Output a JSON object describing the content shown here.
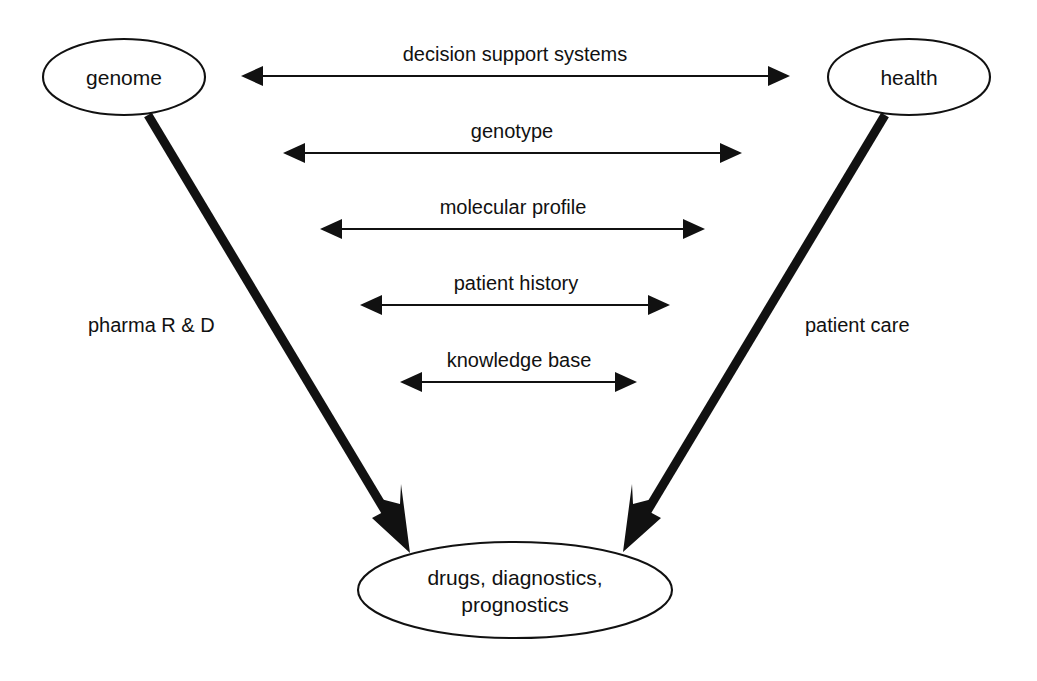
{
  "diagram": {
    "background_color": "#ffffff",
    "stroke_color": "#111111",
    "nodes": [
      {
        "id": "genome",
        "label": "genome",
        "shape": "ellipse",
        "cx": 124,
        "cy": 77,
        "rx": 81,
        "ry": 38
      },
      {
        "id": "health",
        "label": "health",
        "shape": "ellipse",
        "cx": 909,
        "cy": 77,
        "rx": 81,
        "ry": 38
      },
      {
        "id": "outputs",
        "label_line_1": "drugs, diagnostics,",
        "label_line_2": "prognostics",
        "shape": "ellipse",
        "cx": 515,
        "cy": 590,
        "rx": 157,
        "ry": 48
      }
    ],
    "bidirectional_arrows": [
      {
        "id": "decision-support-systems",
        "label": "decision support systems",
        "x1": 241,
        "x2": 790,
        "y": 76,
        "label_y": 61
      },
      {
        "id": "genotype",
        "label": "genotype",
        "x1": 283,
        "x2": 742,
        "y": 153,
        "label_y": 138
      },
      {
        "id": "molecular-profile",
        "label": "molecular profile",
        "x1": 320,
        "x2": 705,
        "y": 229,
        "label_y": 214
      },
      {
        "id": "patient-history",
        "label": "patient history",
        "x1": 360,
        "x2": 670,
        "y": 305,
        "label_y": 290
      },
      {
        "id": "knowledge-base",
        "label": "knowledge base",
        "x1": 400,
        "x2": 637,
        "y": 382,
        "label_y": 367
      }
    ],
    "thick_edges": [
      {
        "id": "pharma-rd",
        "label": "pharma R & D",
        "from": "genome",
        "to": "outputs",
        "x1": 148,
        "y1": 115,
        "x2": 410,
        "y2": 553,
        "label_x": 88,
        "label_y": 332
      },
      {
        "id": "patient-care",
        "label": "patient care",
        "from": "health",
        "to": "outputs",
        "x1": 885,
        "y1": 115,
        "x2": 623,
        "y2": 552,
        "label_x": 805,
        "label_y": 332
      }
    ]
  }
}
